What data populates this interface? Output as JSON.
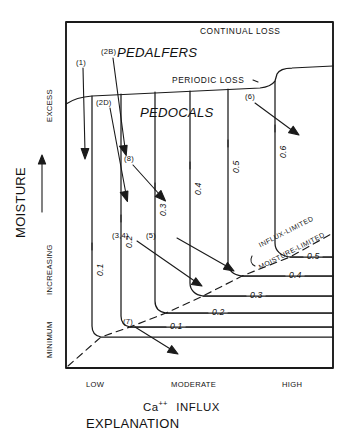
{
  "figure": {
    "title_bottom": "EXPLANATION",
    "axes": {
      "y": {
        "name": "MOISTURE",
        "direction_label": "INCREASING",
        "direction_arrow": "up-arrow-icon",
        "top_label": "EXCESS",
        "bottom_label": "MINIMUM"
      },
      "x": {
        "name": "Ca  INFLUX",
        "name_prefix": "Ca",
        "name_superscript": "++",
        "name_suffix": "INFLUX",
        "ticks": [
          "LOW",
          "MODERATE",
          "HIGH"
        ]
      }
    },
    "zones": [
      {
        "id": "continual-loss",
        "label": "CONTINUAL LOSS"
      },
      {
        "id": "pedalfers",
        "label": "PEDALFERS"
      },
      {
        "id": "periodic-loss",
        "label": "PERIODIC LOSS"
      },
      {
        "id": "pedocals",
        "label": "PEDOCALS"
      },
      {
        "id": "influx-limited",
        "label": "INFLUX-LIMITED"
      },
      {
        "id": "moisture-limited",
        "label": "MOISTURE-LIMITED"
      }
    ],
    "contours_vertical": [
      {
        "id": "v01",
        "label": "0.1"
      },
      {
        "id": "v02",
        "label": "0.2"
      },
      {
        "id": "v03",
        "label": "0.3"
      },
      {
        "id": "v04",
        "label": "0.4"
      },
      {
        "id": "v05",
        "label": "0.5"
      },
      {
        "id": "v06",
        "label": "0.6"
      }
    ],
    "contours_horizontal": [
      {
        "id": "h01",
        "label": "0.1"
      },
      {
        "id": "h02",
        "label": "0.2"
      },
      {
        "id": "h03",
        "label": "0.3"
      },
      {
        "id": "h04",
        "label": "0.4"
      },
      {
        "id": "h05",
        "label": "0.5"
      }
    ],
    "callouts": [
      {
        "id": "c1",
        "label": "(1)"
      },
      {
        "id": "c2b",
        "label": "(2B)"
      },
      {
        "id": "c2d",
        "label": "(2D)"
      },
      {
        "id": "c8",
        "label": "(8)"
      },
      {
        "id": "c34",
        "label": "(3,4)"
      },
      {
        "id": "c5",
        "label": "(5)"
      },
      {
        "id": "c6",
        "label": "(6)"
      },
      {
        "id": "c7",
        "label": "(7)"
      }
    ],
    "colors": {
      "ink": "#111111",
      "line": "#222222",
      "background": "#ffffff"
    }
  }
}
